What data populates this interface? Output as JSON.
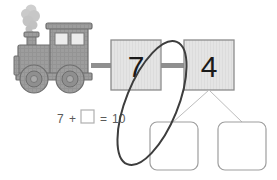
{
  "page": {
    "background_color": "#ffffff"
  },
  "locomotive": {
    "name": "train-engine",
    "body_color": "#9a9a9a",
    "outline_color": "#6e6e6e",
    "smoke_color": "#c9c9c9",
    "window_color": "#e8e8e8",
    "wheel_hub_color": "#8a8a8a"
  },
  "train_cars": [
    {
      "label": "7",
      "fill": "#e2e2e2",
      "border": "#8c8c8c"
    },
    {
      "label": "4",
      "fill": "#e2e2e2",
      "border": "#8c8c8c"
    }
  ],
  "equation": {
    "left_number": "7",
    "plus_sign": "+",
    "blank_box": "",
    "equals_sign": "=",
    "result": "10",
    "text_color": "#5a5a5a",
    "box_border": "#b0b0b0"
  },
  "answer_boxes": [
    {
      "label": "",
      "fill": "#ffffff",
      "border": "#9e9e9e"
    },
    {
      "label": "",
      "fill": "#ffffff",
      "border": "#9e9e9e"
    }
  ],
  "connectors": {
    "color": "#bdbdbd",
    "coupling_color": "#8f8f8f"
  },
  "annotation": {
    "name": "hand-drawn-ellipse",
    "color": "#3d3d3d",
    "stroke_width": "2"
  }
}
